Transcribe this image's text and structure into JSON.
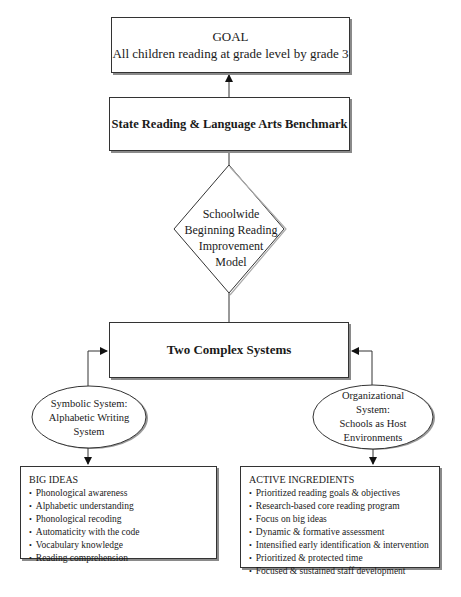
{
  "goal": {
    "title": "GOAL",
    "subtitle": "All children reading at grade level by grade 3"
  },
  "benchmark": {
    "label": "State Reading & Language Arts Benchmark"
  },
  "model": {
    "lines": [
      "Schoolwide",
      "Beginning Reading",
      "Improvement",
      "Model"
    ]
  },
  "systems": {
    "label": "Two Complex Systems"
  },
  "symbolic_system": {
    "lines": [
      "Symbolic System:",
      "Alphabetic Writing",
      "System"
    ]
  },
  "organizational_system": {
    "lines": [
      "Organizational",
      "System:",
      "Schools as Host",
      "Environments"
    ]
  },
  "big_ideas": {
    "heading": "BIG IDEAS",
    "items": [
      "Phonological awareness",
      "Alphabetic understanding",
      "Phonological recoding",
      "Automaticity with the code",
      "Vocabulary knowledge",
      "Reading comprehension"
    ]
  },
  "active_ingredients": {
    "heading": "ACTIVE INGREDIENTS",
    "items": [
      "Prioritized reading goals & objectives",
      "Research-based core reading program",
      "Focus on big ideas",
      "Dynamic & formative assessment",
      "Intensified early identification & intervention",
      "Prioritized & protected time",
      "Focused & sustained staff development"
    ]
  },
  "colors": {
    "stroke": "#333333",
    "shadow": "#8a8a8a",
    "background": "#ffffff"
  }
}
